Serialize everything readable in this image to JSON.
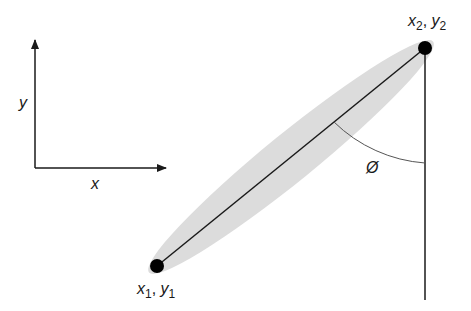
{
  "diagram": {
    "axes": {
      "x_label": "x",
      "y_label": "y"
    },
    "point1": {
      "label_x": "x",
      "label_x_sub": "1",
      "separator": ", ",
      "label_y": "y",
      "label_y_sub": "1"
    },
    "point2": {
      "label_x": "x",
      "label_x_sub": "2",
      "separator": ", ",
      "label_y": "y",
      "label_y_sub": "2"
    },
    "angle_label": "Ø",
    "colors": {
      "ellipse_fill": "#dcdcdc",
      "line": "#1a1a1a",
      "point": "#000000",
      "arc": "#555555"
    }
  }
}
